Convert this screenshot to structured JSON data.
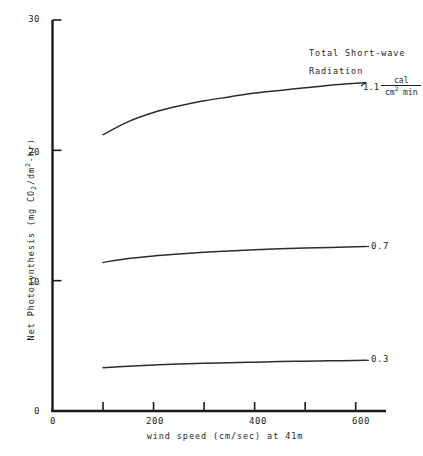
{
  "chart_data": {
    "type": "line",
    "title": "",
    "xlabel": "wind speed (cm/sec) at 41m",
    "ylabel": "Net Photosynthesis (mg CO2/dm2-hr)",
    "xlim": [
      0,
      660
    ],
    "ylim": [
      0,
      30
    ],
    "grid": false,
    "legend_position": "annotated-right",
    "annotations": {
      "legend_title_line1": "Total Short-wave",
      "legend_title_line2": "Radiation",
      "unit_magnitude": "1.1",
      "unit_numerator": "cal",
      "unit_denominator": "cm",
      "unit_denominator_exp": "2",
      "unit_denominator_tail": " min"
    },
    "xticks": [
      {
        "value": 0,
        "label": "0"
      },
      {
        "value": 100,
        "label": ""
      },
      {
        "value": 200,
        "label": "200"
      },
      {
        "value": 300,
        "label": ""
      },
      {
        "value": 400,
        "label": "400"
      },
      {
        "value": 500,
        "label": ""
      },
      {
        "value": 600,
        "label": "600"
      }
    ],
    "yticks": [
      {
        "value": 0,
        "label": "0"
      },
      {
        "value": 10,
        "label": "10"
      },
      {
        "value": 20,
        "label": "20"
      },
      {
        "value": 30,
        "label": "30"
      }
    ],
    "x": [
      100,
      150,
      200,
      250,
      300,
      350,
      400,
      450,
      500,
      550,
      600,
      620
    ],
    "series": [
      {
        "name": "1.1",
        "label": "1.1",
        "values": [
          21.2,
          22.2,
          22.9,
          23.4,
          23.8,
          24.1,
          24.4,
          24.6,
          24.8,
          25.0,
          25.15,
          25.2
        ]
      },
      {
        "name": "0.7",
        "label": "0.7",
        "values": [
          11.4,
          11.7,
          11.9,
          12.05,
          12.18,
          12.28,
          12.37,
          12.45,
          12.5,
          12.55,
          12.6,
          12.62
        ]
      },
      {
        "name": "0.3",
        "label": "0.3",
        "values": [
          3.32,
          3.44,
          3.53,
          3.6,
          3.66,
          3.71,
          3.75,
          3.79,
          3.82,
          3.85,
          3.88,
          3.89
        ]
      }
    ]
  },
  "axis_titles": {
    "x": "wind speed (cm/sec) at 41m",
    "y_prefix": "Net Photosynthesis (mg CO",
    "y_sub": "2",
    "y_mid": "/dm",
    "y_sup": "2",
    "y_suffix": "-hr)"
  },
  "colors": {
    "axis": "#1a1a1a",
    "curve": "#2b2b2b",
    "background": "#ffffff"
  }
}
